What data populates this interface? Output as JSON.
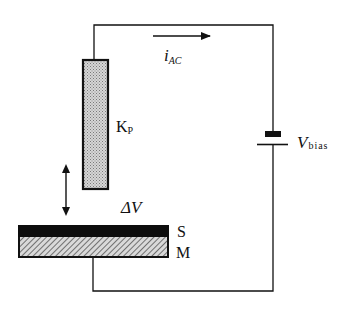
{
  "diagram": {
    "type": "circuit-schematic",
    "colors": {
      "wire": "#111111",
      "probe_fill": "#bdbdbd",
      "surface_layer": "#0d0d0d",
      "metal_hatch": "#9a9a9a",
      "background": "#ffffff"
    },
    "labels": {
      "current": "i",
      "current_sub": "AC",
      "bias": "V",
      "bias_sub": "bias",
      "probe": "K",
      "probe_sub": "P",
      "potential_diff": "ΔV",
      "surface": "S",
      "metal": "M"
    },
    "components": [
      {
        "id": "probe",
        "name": "Kelvin probe tip",
        "label": "KP"
      },
      {
        "id": "sample-surface",
        "name": "Surface layer",
        "label": "S"
      },
      {
        "id": "sample-metal",
        "name": "Metal substrate",
        "label": "M"
      },
      {
        "id": "battery",
        "name": "Bias voltage source",
        "label": "Vbias"
      },
      {
        "id": "current-arrow",
        "name": "AC current direction",
        "label": "iAC"
      },
      {
        "id": "vibration-arrow",
        "name": "Probe vibration (double arrow)"
      }
    ]
  }
}
